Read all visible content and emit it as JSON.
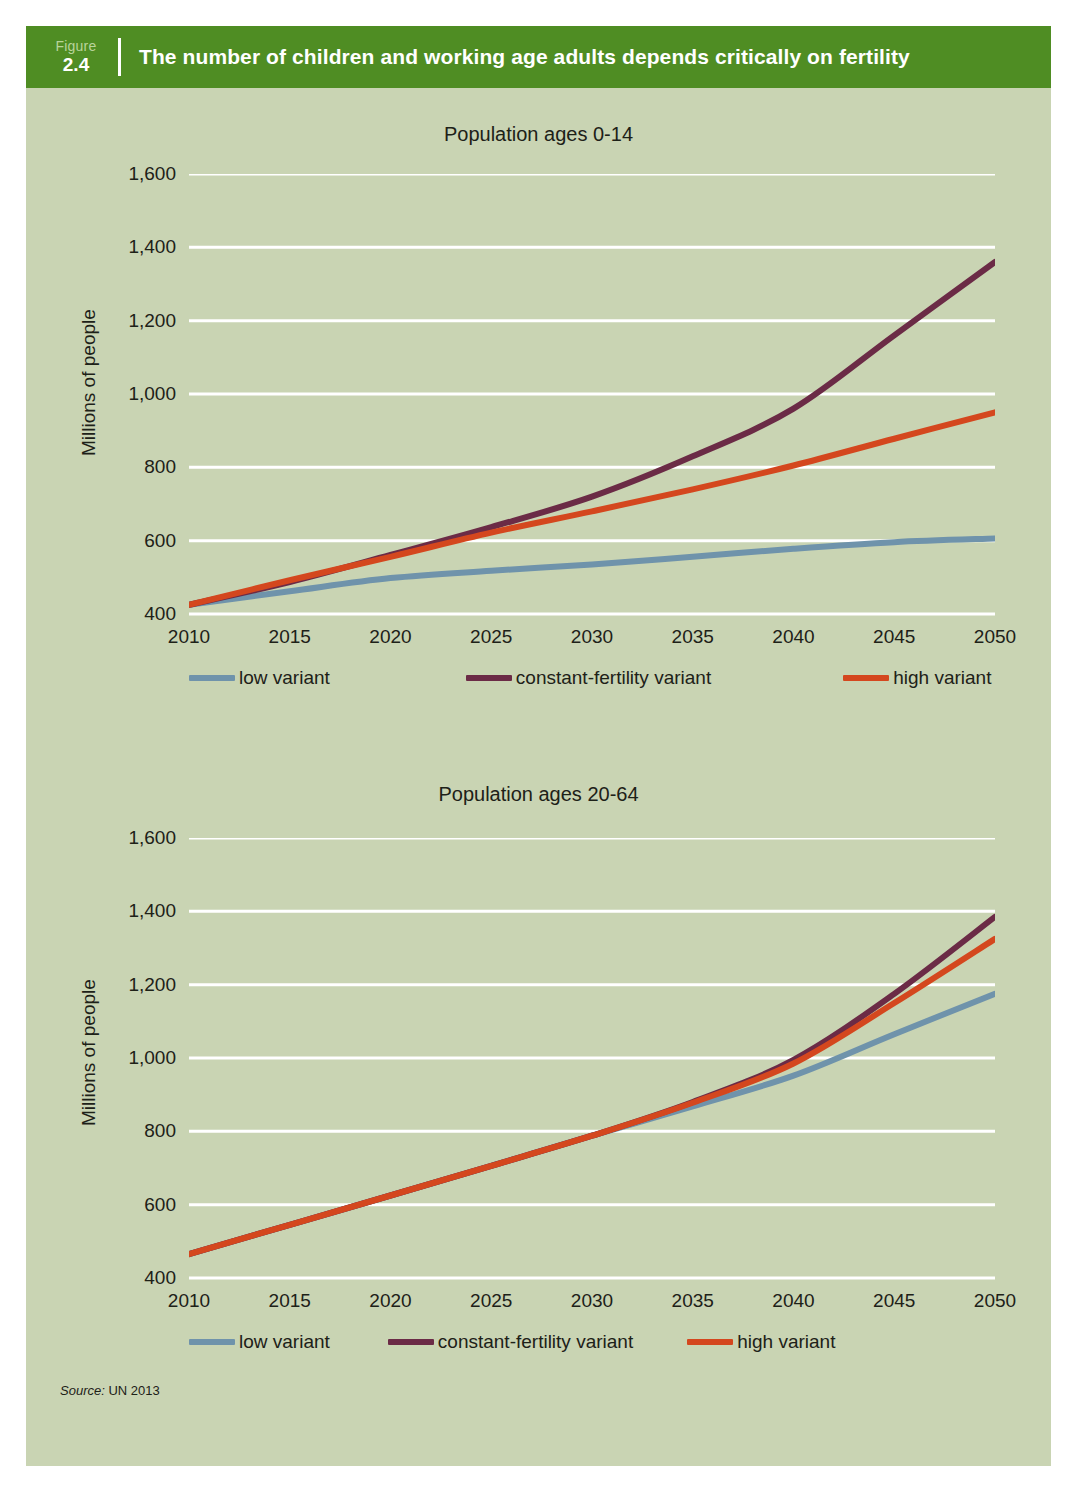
{
  "header": {
    "figure_word": "Figure",
    "figure_number": "2.4",
    "title": "The number of children and working age adults depends critically on fertility",
    "bar_color": "#4f8d23"
  },
  "panel": {
    "background": "#c9d4b3"
  },
  "source": {
    "prefix": "Source:",
    "text": "UN 2013"
  },
  "series_colors": {
    "low_variant": "#6f93ab",
    "constant_fertility_variant": "#6b2b46",
    "high_variant": "#d4471e"
  },
  "chart_data": [
    {
      "type": "line",
      "title": "Population ages 0-14",
      "xlabel": "",
      "ylabel": "Millions of people",
      "x": [
        2010,
        2015,
        2020,
        2025,
        2030,
        2035,
        2040,
        2045,
        2050
      ],
      "xticks": [
        "2010",
        "2015",
        "2020",
        "2025",
        "2030",
        "2035",
        "2040",
        "2045",
        "2050"
      ],
      "yticks": [
        "400",
        "600",
        "800",
        "1,000",
        "1,200",
        "1,400",
        "1,600"
      ],
      "ylim": [
        400,
        1600
      ],
      "xlim": [
        2010,
        2050
      ],
      "grid": true,
      "legend_position": "bottom",
      "series": [
        {
          "name": "low variant",
          "color": "#6f93ab",
          "values": [
            425,
            462,
            498,
            518,
            535,
            556,
            578,
            596,
            606
          ]
        },
        {
          "name": "constant-fertility variant",
          "color": "#6b2b46",
          "values": [
            425,
            487,
            561,
            637,
            720,
            830,
            960,
            1160,
            1360
          ]
        },
        {
          "name": "high variant",
          "color": "#d4471e",
          "values": [
            425,
            492,
            556,
            622,
            680,
            740,
            805,
            878,
            950
          ]
        }
      ]
    },
    {
      "type": "line",
      "title": "Population ages 20-64",
      "xlabel": "",
      "ylabel": "Millions of people",
      "x": [
        2010,
        2015,
        2020,
        2025,
        2030,
        2035,
        2040,
        2045,
        2050
      ],
      "xticks": [
        "2010",
        "2015",
        "2020",
        "2025",
        "2030",
        "2035",
        "2040",
        "2045",
        "2050"
      ],
      "yticks": [
        "400",
        "600",
        "800",
        "1,000",
        "1,200",
        "1,400",
        "1,600"
      ],
      "ylim": [
        400,
        1600
      ],
      "xlim": [
        2010,
        2050
      ],
      "grid": true,
      "legend_position": "bottom",
      "series": [
        {
          "name": "low variant",
          "color": "#6f93ab",
          "values": [
            465,
            545,
            625,
            706,
            788,
            868,
            952,
            1065,
            1175
          ]
        },
        {
          "name": "constant-fertility variant",
          "color": "#6b2b46",
          "values": [
            465,
            545,
            625,
            706,
            788,
            880,
            995,
            1175,
            1385
          ]
        },
        {
          "name": "high variant",
          "color": "#d4471e",
          "values": [
            465,
            545,
            625,
            706,
            788,
            878,
            985,
            1150,
            1325
          ]
        }
      ]
    }
  ],
  "charts_meta": [
    {
      "legend_items": [
        "low variant",
        "constant-fertility variant",
        "high variant"
      ]
    },
    {
      "legend_items": [
        "low variant",
        "constant-fertility variant",
        "high variant"
      ]
    }
  ]
}
